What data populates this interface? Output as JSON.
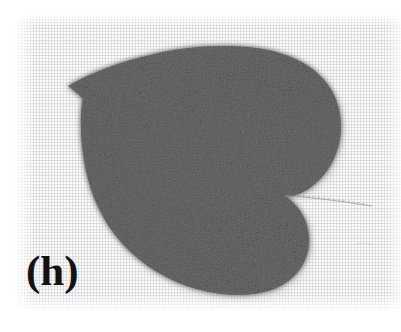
{
  "figure": {
    "panel_label": "(h)",
    "caption_text": "",
    "domain": "Natural-Image",
    "media_type": "grayscale scanned photograph",
    "width_px": 401,
    "height_px": 332
  },
  "background": {
    "name": "woven canvas / textile backdrop",
    "base_color": "#fbfbfb",
    "thread_color": "#b0b2b8",
    "page_margin_color": "#ffffff",
    "plate_left_px": 15,
    "plate_top_px": 14,
    "plate_width_px": 386,
    "plate_height_px": 296
  },
  "subject": {
    "name": "leaf",
    "shape_description": "cordate (heart-shaped) leaf with deep basal sinus, acuminate apex at upper-left",
    "orientation": "apex pointing upper-left, petiole exiting right",
    "fill_color": "#6e6e6e",
    "shadow_color": "#9a9a9a",
    "midvein_color": "#565656",
    "bbox": {
      "x": 65,
      "y": 46,
      "width": 277,
      "height": 250
    },
    "apex_point": {
      "x": 68,
      "y": 86
    },
    "sinus_point": {
      "x": 286,
      "y": 197
    },
    "parts": [
      {
        "name": "leaf-blade",
        "tone": "dark gray, heavily grained"
      },
      {
        "name": "upper-lobe",
        "tone": "dark gray"
      },
      {
        "name": "lower-lobe",
        "tone": "dark gray"
      },
      {
        "name": "midrib",
        "tone": "slightly darker streak"
      },
      {
        "name": "petiole",
        "tone": "very faint thin line"
      }
    ]
  },
  "petiole": {
    "name": "petiole-stem",
    "start": {
      "x": 285,
      "y": 196
    },
    "end": {
      "x": 372,
      "y": 205
    },
    "color": "#a9a9a9",
    "stroke_width_px": 1
  },
  "colors": {
    "paper_white": "#ffffff",
    "canvas_light": "#fbfbfb",
    "canvas_thread": "#b0b2b8",
    "leaf_dark": "#5c5c5c",
    "leaf_mid": "#6e6e6e",
    "leaf_light": "#8a8a8a",
    "label_black": "#121212"
  }
}
